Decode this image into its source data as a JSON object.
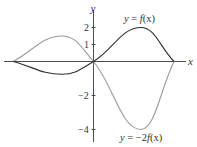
{
  "chart_data": {
    "type": "line",
    "title": "",
    "xlabel": "x",
    "ylabel": "y",
    "xlim": [
      -1,
      1
    ],
    "ylim": [
      -4.7,
      3.0
    ],
    "yticks": [
      2,
      1,
      -2,
      -4
    ],
    "ytick_labels": [
      "2",
      "1",
      "−2",
      "−4"
    ],
    "xticks": [],
    "grid": false,
    "legend": null,
    "series": [
      {
        "name": "y = f(x)",
        "color": "#2e2e2e",
        "key_points": [
          {
            "x": -1.0,
            "y": 0
          },
          {
            "x": -0.39,
            "y": -0.75
          },
          {
            "x": 0.0,
            "y": 0
          },
          {
            "x": 0.59,
            "y": 2.0
          },
          {
            "x": 1.0,
            "y": 0
          }
        ]
      },
      {
        "name": "y = −2f(x)",
        "color": "#9a9a9a",
        "key_points": [
          {
            "x": -1.0,
            "y": 0
          },
          {
            "x": -0.39,
            "y": 1.5
          },
          {
            "x": 0.0,
            "y": 0
          },
          {
            "x": 0.59,
            "y": -4.0
          },
          {
            "x": 1.0,
            "y": 0
          }
        ]
      }
    ],
    "annotations": [
      {
        "text": "y = f(x)",
        "near": "peak of f(x)"
      },
      {
        "text": "y = −2f(x)",
        "near": "minimum of −2f(x)"
      }
    ]
  },
  "labels": {
    "x_axis": "x",
    "y_axis": "y",
    "tick_2": "2",
    "tick_1": "1",
    "tick_m2": "−2",
    "tick_m4": "−4",
    "f_label_y": "y",
    "f_label_eq": " = ",
    "f_label_fn": "f",
    "f_label_arg": "(x)",
    "g_label_y": "y",
    "g_label_eq": " = −2",
    "g_label_fn": "f",
    "g_label_arg": "(x)"
  }
}
